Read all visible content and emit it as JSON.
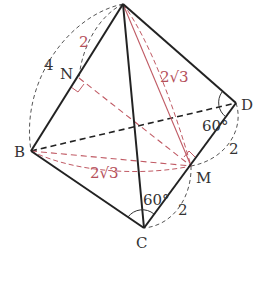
{
  "diagram": {
    "type": "tetrahedron-geometry",
    "colors": {
      "edge": "#222222",
      "hidden": "#222222",
      "aux": "#c05a64",
      "arc": "#555555",
      "label": "#333333",
      "red_label": "#b5505a"
    },
    "points": {
      "A": {
        "label": "",
        "x": 123,
        "y": 4
      },
      "B": {
        "label": "B",
        "x": 31,
        "y": 151
      },
      "C": {
        "label": "C",
        "x": 144,
        "y": 228
      },
      "D": {
        "label": "D",
        "x": 236,
        "y": 103
      },
      "M": {
        "label": "M",
        "x": 191,
        "y": 166
      },
      "N": {
        "label": "N",
        "x": 79,
        "y": 78
      }
    },
    "labels": {
      "AB_length": "4",
      "AN_length": "2",
      "AM_length": "2√3",
      "BM_length": "2√3",
      "DM_length": "2",
      "MC_length": "2",
      "angle_D": "60°",
      "angle_C": "60°"
    }
  }
}
